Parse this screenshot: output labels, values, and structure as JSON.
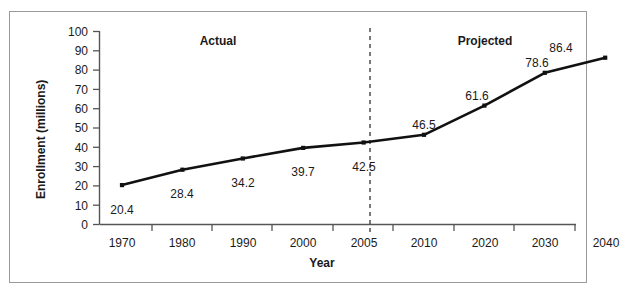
{
  "chart_data": {
    "type": "line",
    "title": "",
    "xlabel": "Year",
    "ylabel": "Enrollment (millions)",
    "categories": [
      "1970",
      "1980",
      "1990",
      "2000",
      "2005",
      "2010",
      "2020",
      "2030",
      "2040"
    ],
    "values": [
      20.4,
      28.4,
      34.2,
      39.7,
      42.5,
      46.5,
      61.6,
      78.6,
      86.4
    ],
    "point_labels": [
      "20.4",
      "28.4",
      "34.2",
      "39.7",
      "42.5",
      "46.5",
      "61.6",
      "78.6",
      "86.4"
    ],
    "ylim": [
      0,
      100
    ],
    "yticks": [
      "0",
      "10",
      "20",
      "30",
      "40",
      "50",
      "60",
      "70",
      "80",
      "90",
      "100"
    ],
    "grid": false,
    "legend": "none",
    "series": [
      {
        "name": "Enrollment",
        "values": [
          20.4,
          28.4,
          34.2,
          39.7,
          42.5,
          46.5,
          61.6,
          78.6,
          86.4
        ],
        "marker": "square",
        "color": "#111111"
      }
    ],
    "annotations": [
      {
        "name": "actual-region-label",
        "text": "Actual",
        "x_category": "1990"
      },
      {
        "name": "projected-region-label",
        "text": "Projected",
        "x_category": "2025"
      },
      {
        "name": "divider",
        "text": "",
        "style": "dashed-vertical",
        "between": [
          "2005",
          "2010"
        ]
      }
    ]
  },
  "axes": {
    "y_title": "Enrollment (millions)",
    "x_title": "Year",
    "y_ticks": [
      "100",
      "90",
      "80",
      "70",
      "60",
      "50",
      "40",
      "30",
      "20",
      "10",
      "0"
    ],
    "x_ticks": [
      "1970",
      "1980",
      "1990",
      "2000",
      "2005",
      "2010",
      "2020",
      "2030",
      "2040"
    ]
  },
  "regions": {
    "actual": "Actual",
    "projected": "Projected"
  },
  "data_labels": [
    "20.4",
    "28.4",
    "34.2",
    "39.7",
    "42.5",
    "46.5",
    "61.6",
    "78.6",
    "86.4"
  ],
  "colors": {
    "line": "#111111",
    "marker": "#111111",
    "axis": "#555555",
    "frame": "#9a9a9a",
    "divider": "#333333",
    "text": "#1a1a1a"
  }
}
